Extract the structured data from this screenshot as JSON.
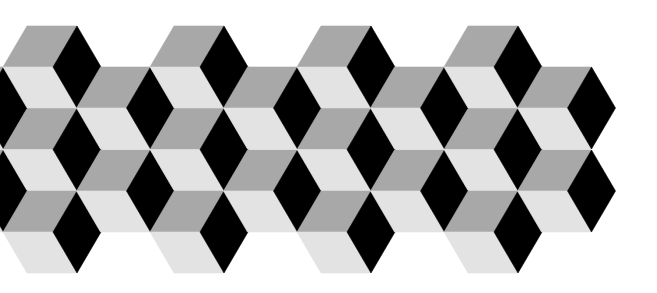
{
  "pattern": {
    "name": "tumbling-blocks",
    "background": "#ffffff",
    "colors": {
      "top_face": "#a8a8a8",
      "left_face": "#e3e3e3",
      "right_face": "#000000"
    },
    "geometry": {
      "origin_x": 77,
      "column_step": 73.5,
      "row_step": 82,
      "half_width": 24,
      "half_height": 41,
      "top_edge_length": 50
    },
    "cubes": [
      {
        "cx": 3.5,
        "cy": 108
      },
      {
        "cx": 3.5,
        "cy": 191
      },
      {
        "cx": 77,
        "cy": 67
      },
      {
        "cx": 77,
        "cy": 149.5
      },
      {
        "cx": 77,
        "cy": 232
      },
      {
        "cx": 150.5,
        "cy": 108
      },
      {
        "cx": 150.5,
        "cy": 191
      },
      {
        "cx": 224,
        "cy": 67
      },
      {
        "cx": 224,
        "cy": 149.5
      },
      {
        "cx": 224,
        "cy": 232
      },
      {
        "cx": 297.5,
        "cy": 108
      },
      {
        "cx": 297.5,
        "cy": 191
      },
      {
        "cx": 371,
        "cy": 67
      },
      {
        "cx": 371,
        "cy": 149.5
      },
      {
        "cx": 371,
        "cy": 232
      },
      {
        "cx": 444.5,
        "cy": 108
      },
      {
        "cx": 444.5,
        "cy": 191
      },
      {
        "cx": 518,
        "cy": 67
      },
      {
        "cx": 518,
        "cy": 149.5
      },
      {
        "cx": 518,
        "cy": 232
      },
      {
        "cx": 591.5,
        "cy": 108
      },
      {
        "cx": 591.5,
        "cy": 191
      }
    ]
  }
}
